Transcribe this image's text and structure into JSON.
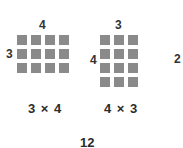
{
  "diagram": {
    "left_array": {
      "rows": 3,
      "cols": 4,
      "top_label": "4",
      "side_label": "3",
      "equation": "3 × 4"
    },
    "right_array": {
      "rows": 4,
      "cols": 3,
      "top_label": "3",
      "side_label": "4",
      "equation": "4 × 3"
    },
    "product": "12",
    "edge_digit": "2",
    "colors": {
      "square": "#8a8a8a",
      "text": "#2b2b2b",
      "background": "#ffffff"
    }
  }
}
